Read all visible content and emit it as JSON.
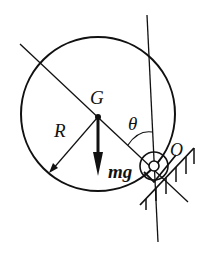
{
  "diagram": {
    "labels": {
      "center": "G",
      "radius": "R",
      "angle": "θ",
      "weight": "mg",
      "pivot": "O"
    },
    "colors": {
      "stroke": "#111111",
      "background": "#ffffff"
    }
  }
}
